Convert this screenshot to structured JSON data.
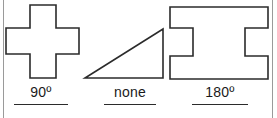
{
  "figure": {
    "background_color": "#ffffff",
    "stroke_color": "#2b2b2b",
    "frame_rule_color": "#9a9a9a",
    "width": 277,
    "height": 118,
    "items": [
      {
        "shape_name": "cross-plus-shape",
        "label": "90º",
        "rule_width": 54
      },
      {
        "shape_name": "right-triangle-shape",
        "label": "none",
        "rule_width": 52
      },
      {
        "shape_name": "i-beam-shape",
        "label": "180º",
        "rule_width": 56
      }
    ]
  }
}
